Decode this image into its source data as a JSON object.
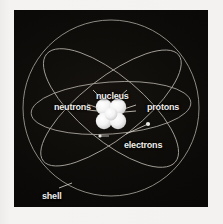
{
  "figure": {
    "background_color": "#f3f1ef",
    "panel_color": "#0a0907",
    "line_color": "#b9b6ae",
    "label_color": "#f0eeea",
    "nucleus_color": "#ffffff"
  },
  "labels": {
    "nucleus": "nucleus",
    "neutrons": "neutrons",
    "protons": "protons",
    "electrons": "electrons",
    "shell": "shell"
  },
  "diagram": {
    "shell": {
      "name": "outer-shell-sphere",
      "cx": 97,
      "cy": 98,
      "r": 88
    },
    "orbits": [
      {
        "name": "orbit-1",
        "rx": 86,
        "ry": 30,
        "rotation": -38
      },
      {
        "name": "orbit-2",
        "rx": 84,
        "ry": 32,
        "rotation": 40
      },
      {
        "name": "orbit-3",
        "rx": 80,
        "ry": 26,
        "rotation": -4
      }
    ],
    "nucleus_particles": [
      {
        "name": "proton",
        "cx": 104,
        "cy": 97,
        "r": 8
      },
      {
        "name": "neutron",
        "cx": 90,
        "cy": 97,
        "r": 8
      },
      {
        "name": "proton",
        "cx": 104,
        "cy": 111,
        "r": 8
      },
      {
        "name": "neutron",
        "cx": 90,
        "cy": 111,
        "r": 8
      },
      {
        "name": "neutron",
        "cx": 97,
        "cy": 104,
        "r": 7
      }
    ],
    "electrons": [
      {
        "name": "electron-dot-left",
        "cx": 86,
        "cy": 126,
        "r": 1.6
      },
      {
        "name": "electron-dot-right",
        "cx": 134,
        "cy": 114,
        "r": 2.0
      }
    ],
    "leader_lines": [
      {
        "name": "leader-nucleus-left",
        "x1": 88,
        "y1": 90,
        "x2": 79,
        "y2": 81
      },
      {
        "name": "leader-nucleus-right",
        "x1": 103,
        "y1": 90,
        "x2": 112,
        "y2": 81
      },
      {
        "name": "leader-neutrons",
        "x1": 73,
        "y1": 97,
        "x2": 84,
        "y2": 99
      },
      {
        "name": "leader-protons",
        "x1": 122,
        "y1": 98,
        "x2": 110,
        "y2": 100
      },
      {
        "name": "leader-electrons-a",
        "x1": 95,
        "y1": 126,
        "x2": 86,
        "y2": 126
      },
      {
        "name": "leader-electrons-b",
        "x1": 112,
        "y1": 124,
        "x2": 134,
        "y2": 114
      },
      {
        "name": "leader-shell",
        "x1": 45,
        "y1": 179,
        "x2": 57,
        "y2": 174
      }
    ]
  }
}
